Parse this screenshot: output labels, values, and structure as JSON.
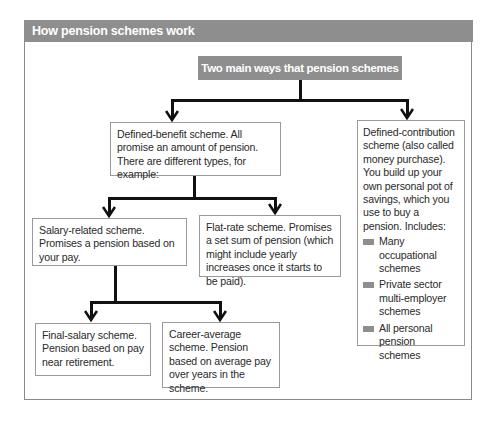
{
  "header": {
    "title": "How pension schemes work"
  },
  "diagram": {
    "root": {
      "label": "Two main ways that pension schemes work"
    },
    "defined_benefit": {
      "label": "Defined-benefit scheme. All promise an amount of pension. There are different types, for example:"
    },
    "defined_contribution": {
      "label": "Defined-contribution scheme (also called money purchase). You build up your own personal pot of savings, which you use to buy a pension. Includes:",
      "items": [
        "Many occupational schemes",
        "Private sector multi-employer schemes",
        "All personal pension schemes"
      ]
    },
    "salary_related": {
      "label": "Salary-related scheme. Promises a pension based on your pay."
    },
    "flat_rate": {
      "label": "Flat-rate scheme.  Promises a set sum of pension (which might include yearly increases once it starts to be paid)."
    },
    "final_salary": {
      "label": "Final-salary scheme. Pension based on pay near retirement."
    },
    "career_average": {
      "label": "Career-average scheme. Pension based on average pay over years in the scheme."
    }
  },
  "colors": {
    "header_bg": "#8e8e8e",
    "box_border": "#9a9a9a",
    "connector": "#111111"
  }
}
